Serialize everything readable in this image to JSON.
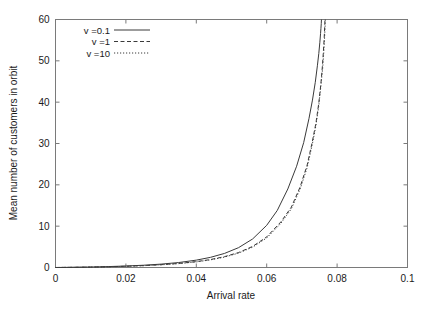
{
  "chart_data": {
    "type": "line",
    "title": "",
    "xlabel": "Arrival rate",
    "ylabel": "Mean number of customers in orbit",
    "xlim": [
      0,
      0.1
    ],
    "ylim": [
      0,
      60
    ],
    "xticks": [
      0,
      0.02,
      0.04,
      0.06,
      0.08,
      0.1
    ],
    "xticklabels": [
      "0",
      "0.02",
      "0.04",
      "0.06",
      "0.08",
      "0.1"
    ],
    "yticks": [
      0,
      10,
      20,
      30,
      40,
      50,
      60
    ],
    "yticklabels": [
      "0",
      "10",
      "20",
      "30",
      "40",
      "50",
      "60"
    ],
    "grid": false,
    "legend_position": "upper-left-inside",
    "series": [
      {
        "name": "v =0.1",
        "style": "solid",
        "asymptote_x": 0.0756,
        "x": [
          0.0,
          0.005,
          0.01,
          0.015,
          0.02,
          0.025,
          0.03,
          0.035,
          0.04,
          0.044,
          0.048,
          0.052,
          0.056,
          0.06,
          0.063,
          0.066,
          0.0685,
          0.0705,
          0.072,
          0.073,
          0.0738,
          0.0744,
          0.0748,
          0.0751,
          0.0753,
          0.0754,
          0.0755,
          0.07555
        ],
        "y": [
          0.0,
          0.05,
          0.12,
          0.22,
          0.36,
          0.55,
          0.82,
          1.2,
          1.78,
          2.45,
          3.4,
          4.8,
          6.9,
          10.2,
          13.8,
          19.0,
          24.5,
          30.2,
          36.0,
          40.5,
          44.8,
          48.8,
          51.8,
          54.5,
          56.6,
          57.8,
          59.0,
          60.0
        ]
      },
      {
        "name": "v =1",
        "style": "dashed",
        "asymptote_x": 0.0765,
        "x": [
          0.0,
          0.005,
          0.01,
          0.015,
          0.02,
          0.025,
          0.03,
          0.035,
          0.04,
          0.044,
          0.048,
          0.052,
          0.056,
          0.06,
          0.064,
          0.067,
          0.0695,
          0.0715,
          0.073,
          0.074,
          0.0748,
          0.0754,
          0.0758,
          0.0761,
          0.0763,
          0.0764,
          0.0765,
          0.07655
        ],
        "y": [
          0.0,
          0.04,
          0.1,
          0.18,
          0.3,
          0.46,
          0.68,
          0.98,
          1.42,
          1.92,
          2.62,
          3.62,
          5.1,
          7.4,
          11.0,
          14.6,
          19.5,
          24.8,
          30.6,
          35.0,
          39.8,
          44.5,
          48.5,
          52.2,
          55.0,
          56.8,
          58.6,
          60.0
        ]
      },
      {
        "name": "v =10",
        "style": "dotted",
        "asymptote_x": 0.0766,
        "x": [
          0.0,
          0.005,
          0.01,
          0.015,
          0.02,
          0.025,
          0.03,
          0.035,
          0.04,
          0.044,
          0.048,
          0.052,
          0.056,
          0.06,
          0.064,
          0.067,
          0.0695,
          0.0715,
          0.073,
          0.074,
          0.0748,
          0.0754,
          0.0759,
          0.0762,
          0.0764,
          0.0765,
          0.0766,
          0.07665
        ],
        "y": [
          0.0,
          0.04,
          0.09,
          0.17,
          0.28,
          0.44,
          0.65,
          0.94,
          1.36,
          1.84,
          2.52,
          3.48,
          4.92,
          7.15,
          10.65,
          14.2,
          19.0,
          24.2,
          30.0,
          34.4,
          39.2,
          44.0,
          48.2,
          51.9,
          54.8,
          56.6,
          58.5,
          60.0
        ]
      }
    ],
    "legend": [
      {
        "label": "v =0.1",
        "style": "solid"
      },
      {
        "label": "v =1",
        "style": "dashed"
      },
      {
        "label": "v =10",
        "style": "dotted"
      }
    ]
  }
}
